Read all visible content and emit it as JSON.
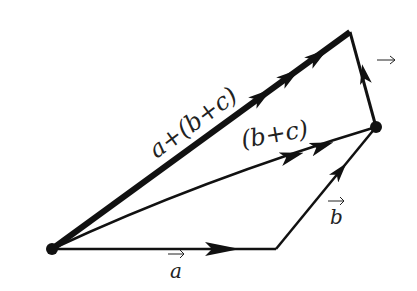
{
  "diagram": {
    "labels": {
      "a": "a",
      "b": "b",
      "c_arrow": "→",
      "b_plus_c": "(b+c)",
      "a_plus_bc": "a+(b+c)"
    },
    "points": {
      "origin": [
        52,
        249
      ],
      "a_end": [
        276,
        249
      ],
      "b_end": [
        376,
        127
      ],
      "c_end": [
        350,
        32
      ]
    },
    "colors": {
      "ink": "#111111",
      "background": "#ffffff"
    }
  }
}
